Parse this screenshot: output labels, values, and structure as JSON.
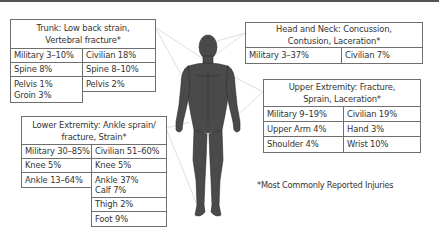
{
  "trunk": {
    "title_line1": "Trunk: Low back strain,",
    "title_line2": "Vertebral fracture*",
    "rows": [
      {
        "left": "Military 3–10%",
        "right": "Civilian 18%"
      },
      {
        "left": "Spine 8%",
        "right": "Spine 8–10%"
      },
      {
        "left": "Pelvis 1%",
        "right": "Pelvis 2%"
      },
      {
        "left": "Groin 3%",
        "right": ""
      }
    ]
  },
  "head_neck": {
    "title_line1": "Head and Neck: Concussion,",
    "title_line2": "Contusion, Laceration*",
    "rows": [
      {
        "left": "Military 3–37%",
        "right": "Civilian 7%"
      }
    ]
  },
  "upper_extremity": {
    "title_line1": "Upper Extremity: Fracture,",
    "title_line2": "Sprain, Laceration*",
    "rows": [
      {
        "left": "Military 9–19%",
        "right": "Civilian 19%"
      },
      {
        "left": "Upper Arm 4%",
        "right": "Hand 3%"
      },
      {
        "left": "Shoulder 4%",
        "right": "Wrist 10%"
      }
    ]
  },
  "lower_extremity": {
    "title_line1": "Lower Extremity: Ankle sprain/",
    "title_line2": "fracture, Strain*",
    "rows": [
      {
        "left": "Military 30–85%",
        "right": "Civilian 51–60%"
      },
      {
        "left": "Knee 5%",
        "right": "Knee 5%"
      },
      {
        "left": "Ankle 13–64%",
        "right": "Ankle 37%"
      },
      {
        "left": "",
        "right": "Calf 7%"
      },
      {
        "left": "",
        "right": "Thigh 2%"
      },
      {
        "left": "",
        "right": "Foot 9%"
      }
    ]
  },
  "footnote": "*Most Commonly Reported Injuries",
  "colors": {
    "figure": "#4a4a4a",
    "border": "#6f6f6f",
    "connector": "#d8d8d8"
  }
}
